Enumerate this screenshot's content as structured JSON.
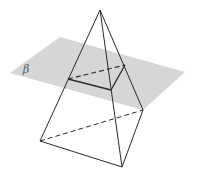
{
  "figure": {
    "plane_label": "β",
    "colors": {
      "plane_fill": "#d6d6d6",
      "edge": "#2a2a2a",
      "label": "#555555"
    },
    "points": {
      "apex": [
        100,
        10
      ],
      "base_left": [
        40,
        141
      ],
      "base_front": [
        122,
        167
      ],
      "base_right": [
        143,
        110
      ],
      "section_left": [
        68,
        79
      ],
      "section_front": [
        111,
        90
      ],
      "section_right": [
        125,
        65
      ]
    },
    "plane_polygon": [
      [
        10,
        73
      ],
      [
        60,
        37
      ],
      [
        185,
        72
      ],
      [
        143,
        110
      ],
      [
        136,
        112
      ],
      [
        64,
        88
      ]
    ]
  }
}
